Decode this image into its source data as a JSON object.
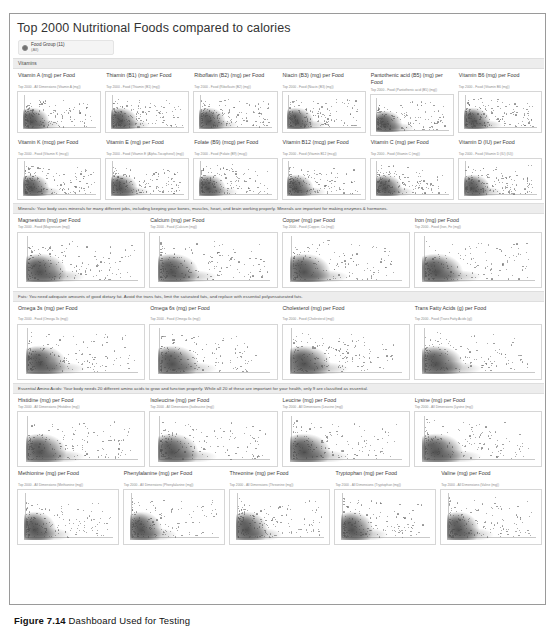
{
  "dashboard": {
    "title": "Top 2000 Nutritional Foods compared to calories",
    "filter": {
      "label": "Food Group (11)",
      "value": "(All)"
    },
    "sections": [
      {
        "name": "vitamins",
        "banner": "Vitamins",
        "rows": [
          [
            {
              "title": "Vitamin A (mg) per Food",
              "sub": "Top 2000 - All Dimensions (Vitamin A (mg))"
            },
            {
              "title": "Thiamin (B1) (mg) per Food",
              "sub": "Top 2000 - Food (Thiamin (B1) (mg))"
            },
            {
              "title": "Riboflavin (B2) (mg) per Food",
              "sub": "Top 2000 - Food (Riboflavin (B2) (mg))"
            },
            {
              "title": "Niacin (B3) (mg) per Food",
              "sub": "Top 2000 - Food (Niacin (B3) (mg))"
            },
            {
              "title": "Pantothenic acid (B5) (mg) per Food",
              "sub": "Top 2000 - Food (Pantothenic acid (B5) (mg))"
            },
            {
              "title": "Vitamin B6 (mg) per Food",
              "sub": "Top 2000 - Food (Vitamin B6 (mg))"
            }
          ],
          [
            {
              "title": "Vitamin K (mcg) per Food",
              "sub": "Top 2000 - Food (Vitamin K (mcg))"
            },
            {
              "title": "Vitamin E (mg) per Food",
              "sub": "Top 2000 - Food (Vitamin E (Alpha-Tocopherol) (mg))"
            },
            {
              "title": "Folate (B9) (mcg) per Food",
              "sub": "Top 2000 - Food (Folate (B9) (mcg))"
            },
            {
              "title": "Vitamin B12 (mcg) per Food",
              "sub": "Top 2000 - Food (Vitamin B12 (mcg))"
            },
            {
              "title": "Vitamin C (mg) per Food",
              "sub": "Top 2000 - Food (Vitamin C (mg))"
            },
            {
              "title": "Vitamin D (IU) per Food",
              "sub": "Top 2000 - Food (Vitamin D (IU) (IU))"
            }
          ]
        ]
      },
      {
        "name": "minerals",
        "banner": "Minerals: Your body uses minerals for many different jobs, including keeping your bones, muscles, heart, and brain working properly. Minerals are important for making enzymes & hormones.",
        "rows": [
          [
            {
              "title": "Magnesium (mg) per Food",
              "sub": "Top 2000 - Food (Magnesium (mg))"
            },
            {
              "title": "Calcium (mg) per Food",
              "sub": "Top 2000 - Food (Calcium (mg))"
            },
            {
              "title": "Copper (mg) per Food",
              "sub": "Top 2000 - Food (Copper, Cu (mg))"
            },
            {
              "title": "Iron (mg) per Food",
              "sub": "Top 2000 - Food (Iron, Fe (mg))"
            }
          ]
        ]
      },
      {
        "name": "fats",
        "banner": "Fats: You need adequate amounts of good dietary fat. Avoid the trans fats, limit the saturated fats, and replace with essential polyunsaturated fats.",
        "rows": [
          [
            {
              "title": "Omega 3s (mg) per Food",
              "sub": "Top 2000 - Food (Omega 3s (mg))"
            },
            {
              "title": "Omega 6s (mg) per Food",
              "sub": "Top 2000 - Food (Omega 6s (mg))"
            },
            {
              "title": "Cholesterol (mg) per Food",
              "sub": "Top 2000 - Food (Cholesterol (mg))"
            },
            {
              "title": "Trans Fatty Acids (g) per Food",
              "sub": "Top 2000 - Food (Trans Fatty Acids (g))"
            }
          ]
        ]
      },
      {
        "name": "amino-acids",
        "banner": "Essential Amino Acids: Your body needs 20 different amino acids to grow and function properly. While all 20 of these are important for your health, only 9 are classified as essential.",
        "rows": [
          [
            {
              "title": "Histidine (mg) per Food",
              "sub": "Top 2000 - All Dimensions (Histidine (mg))"
            },
            {
              "title": "Isoleucine (mg) per Food",
              "sub": "Top 2000 - All Dimensions (Isoleucine (mg))"
            },
            {
              "title": "Leucine (mg) per Food",
              "sub": "Top 2000 - All Dimensions (Leucine (mg))"
            },
            {
              "title": "Lysine (mg) per Food",
              "sub": "Top 2000 - All Dimensions (Lysine (mg))"
            }
          ],
          [
            {
              "title": "Methionine (mg) per Food",
              "sub": "Top 2000 - All Dimensions (Methionine (mg))"
            },
            {
              "title": "Phenylalanine (mg) per Food",
              "sub": "Top 2000 - All Dimensions (Phenylalanine (mg))"
            },
            {
              "title": "Threonine (mg) per Food",
              "sub": "Top 2000 - All Dimensions (Threonine (mg))"
            },
            {
              "title": "Tryptophan (mg) per Food",
              "sub": "Top 2000 - All Dimensions (Tryptophan (mg))"
            },
            {
              "title": "Valine (mg) per Food",
              "sub": "Top 2000 - All Dimensions (Valine (mg))"
            }
          ]
        ]
      }
    ]
  },
  "figure_caption": {
    "number": "Figure 7.14",
    "text": "Dashboard Used for Testing"
  },
  "chart_data": {
    "type": "scatter",
    "title": "Top 2000 Nutritional Foods compared to calories",
    "xlabel": "Calories",
    "ylabel": "Nutrient amount per Food",
    "grid": false,
    "legend": null,
    "point_count_per_panel": 2000,
    "panels": [
      {
        "name": "Vitamin A (mg) per Food",
        "xlabel": "Calories",
        "ylabel": "Vitamin A (mg)"
      },
      {
        "name": "Thiamin (B1) (mg) per Food",
        "xlabel": "Calories",
        "ylabel": "Thiamin (B1) (mg)"
      },
      {
        "name": "Riboflavin (B2) (mg) per Food",
        "xlabel": "Calories",
        "ylabel": "Riboflavin (B2) (mg)"
      },
      {
        "name": "Niacin (B3) (mg) per Food",
        "xlabel": "Calories",
        "ylabel": "Niacin (B3) (mg)"
      },
      {
        "name": "Pantothenic acid (B5) (mg) per Food",
        "xlabel": "Calories",
        "ylabel": "Pantothenic acid (B5) (mg)"
      },
      {
        "name": "Vitamin B6 (mg) per Food",
        "xlabel": "Calories",
        "ylabel": "Vitamin B6 (mg)"
      },
      {
        "name": "Vitamin K (mcg) per Food",
        "xlabel": "Calories",
        "ylabel": "Vitamin K (mcg)"
      },
      {
        "name": "Vitamin E (mg) per Food",
        "xlabel": "Calories",
        "ylabel": "Vitamin E (mg)"
      },
      {
        "name": "Folate (B9) (mcg) per Food",
        "xlabel": "Calories",
        "ylabel": "Folate (B9) (mcg)"
      },
      {
        "name": "Vitamin B12 (mcg) per Food",
        "xlabel": "Calories",
        "ylabel": "Vitamin B12 (mcg)"
      },
      {
        "name": "Vitamin C (mg) per Food",
        "xlabel": "Calories",
        "ylabel": "Vitamin C (mg)"
      },
      {
        "name": "Vitamin D (IU) per Food",
        "xlabel": "Calories",
        "ylabel": "Vitamin D (IU)"
      },
      {
        "name": "Magnesium (mg) per Food",
        "xlabel": "Calories",
        "ylabel": "Magnesium (mg)"
      },
      {
        "name": "Calcium (mg) per Food",
        "xlabel": "Calories",
        "ylabel": "Calcium (mg)"
      },
      {
        "name": "Copper (mg) per Food",
        "xlabel": "Calories",
        "ylabel": "Copper (mg)"
      },
      {
        "name": "Iron (mg) per Food",
        "xlabel": "Calories",
        "ylabel": "Iron (mg)"
      },
      {
        "name": "Omega 3s (mg) per Food",
        "xlabel": "Calories",
        "ylabel": "Omega 3s (mg)"
      },
      {
        "name": "Omega 6s (mg) per Food",
        "xlabel": "Calories",
        "ylabel": "Omega 6s (mg)"
      },
      {
        "name": "Cholesterol (mg) per Food",
        "xlabel": "Calories",
        "ylabel": "Cholesterol (mg)"
      },
      {
        "name": "Trans Fatty Acids (g) per Food",
        "xlabel": "Calories",
        "ylabel": "Trans Fatty Acids (g)"
      },
      {
        "name": "Histidine (mg) per Food",
        "xlabel": "Calories",
        "ylabel": "Histidine (mg)"
      },
      {
        "name": "Isoleucine (mg) per Food",
        "xlabel": "Calories",
        "ylabel": "Isoleucine (mg)"
      },
      {
        "name": "Leucine (mg) per Food",
        "xlabel": "Calories",
        "ylabel": "Leucine (mg)"
      },
      {
        "name": "Lysine (mg) per Food",
        "xlabel": "Calories",
        "ylabel": "Lysine (mg)"
      },
      {
        "name": "Methionine (mg) per Food",
        "xlabel": "Calories",
        "ylabel": "Methionine (mg)"
      },
      {
        "name": "Phenylalanine (mg) per Food",
        "xlabel": "Calories",
        "ylabel": "Phenylalanine (mg)"
      },
      {
        "name": "Threonine (mg) per Food",
        "xlabel": "Calories",
        "ylabel": "Threonine (mg)"
      },
      {
        "name": "Tryptophan (mg) per Food",
        "xlabel": "Calories",
        "ylabel": "Tryptophan (mg)"
      },
      {
        "name": "Valine (mg) per Food",
        "xlabel": "Calories",
        "ylabel": "Valine (mg)"
      }
    ]
  }
}
